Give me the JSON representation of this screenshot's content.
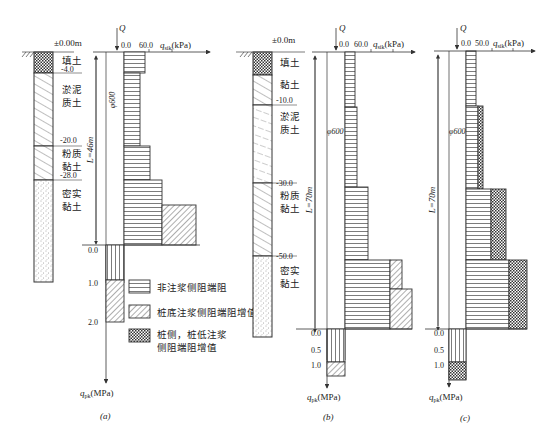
{
  "figure": {
    "panels": [
      {
        "id": "a",
        "caption": "(a)",
        "ground_level": "±0.00m",
        "pile_length": "L=46m",
        "pile_diameter": "φ600",
        "load": "Q",
        "axis_top": {
          "tick0": "0.0",
          "tick1": "60.0",
          "label_q": "q",
          "label_sub": "sik",
          "label_unit": "(kPa)"
        },
        "axis_bottom": {
          "ticks": [
            "0.0",
            "1.0",
            "2.0"
          ],
          "label_q": "q",
          "label_sub": "pk",
          "label_unit": "(MPa)"
        },
        "layers": [
          {
            "name_line1": "填土",
            "name_line2": "",
            "depth_bottom": "-4.0",
            "pattern": "crosshatch"
          },
          {
            "name_line1": "淤泥",
            "name_line2": "质土",
            "depth_bottom": "-20.0",
            "pattern": "diagonal"
          },
          {
            "name_line1": "粉质",
            "name_line2": "黏土",
            "depth_bottom": "-28.0",
            "pattern": "diagonal"
          },
          {
            "name_line1": "密实",
            "name_line2": "黏土",
            "depth_bottom": "",
            "pattern": "dots"
          }
        ]
      },
      {
        "id": "b",
        "caption": "(b)",
        "ground_level": "±0.0m",
        "pile_length": "L=70m",
        "pile_diameter": "φ600",
        "load": "Q",
        "axis_top": {
          "tick0": "0.0",
          "tick1": "60.0",
          "label_q": "q",
          "label_sub": "sik",
          "label_unit": "(kPa)"
        },
        "axis_bottom": {
          "ticks": [
            "0.0",
            "0.5",
            "1.0"
          ],
          "label_q": "q",
          "label_sub": "pk",
          "label_unit": "(MPa)"
        },
        "layers": [
          {
            "name_line1": "填土",
            "name_line2": "",
            "depth_bottom": "",
            "pattern": "crosshatch"
          },
          {
            "name_line1": "黏土",
            "name_line2": "",
            "depth_bottom": "-10.0",
            "pattern": "diagonal"
          },
          {
            "name_line1": "淤泥",
            "name_line2": "质土",
            "depth_bottom": "-30.0",
            "pattern": "diagonal-dash"
          },
          {
            "name_line1": "粉质",
            "name_line2": "黏土",
            "depth_bottom": "-50.0",
            "pattern": "diagonal"
          },
          {
            "name_line1": "密实",
            "name_line2": "黏土",
            "depth_bottom": "",
            "pattern": "dots"
          }
        ]
      },
      {
        "id": "c",
        "caption": "(c)",
        "pile_length": "L=70m",
        "pile_diameter": "φ600",
        "load": "Q",
        "axis_top": {
          "tick0": "0.0",
          "tick1": "50.0",
          "label_q": "q",
          "label_sub": "sik",
          "label_unit": "(kPa)"
        },
        "axis_bottom": {
          "ticks": [
            "0.0",
            "0.5",
            "1.0"
          ],
          "label_q": "q",
          "label_sub": "pk",
          "label_unit": "(MPa)"
        }
      }
    ],
    "legend": [
      {
        "pattern": "horizontal",
        "label_line1": "非注浆侧阻端阻",
        "label_line2": ""
      },
      {
        "pattern": "diagonal",
        "label_line1": "桩底注浆侧阻端阻增值",
        "label_line2": ""
      },
      {
        "pattern": "crosshatch",
        "label_line1": "桩侧，桩低注浆",
        "label_line2": "侧阻端阻增值"
      }
    ],
    "colors": {
      "line": "#333333",
      "background": "#ffffff"
    }
  }
}
